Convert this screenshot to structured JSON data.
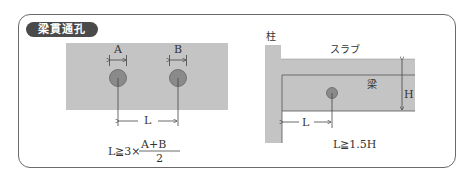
{
  "title": "梁貫通孔",
  "left_diagram": {
    "hole_a_label": "A",
    "hole_b_label": "B",
    "spacing_label": "L",
    "formula": {
      "lhs": "L≧3×",
      "numerator": "A+B",
      "denominator": "2"
    }
  },
  "right_diagram": {
    "column_label": "柱",
    "slab_label": "スラブ",
    "beam_label": "梁",
    "height_label": "H",
    "distance_label": "L",
    "formula": "L≧1.5H"
  },
  "colors": {
    "beam_fill": "#c4c4c4",
    "hole_fill": "#8a8a8a",
    "frame": "#6a6a6a",
    "title_bg": "#4a4a4a"
  }
}
